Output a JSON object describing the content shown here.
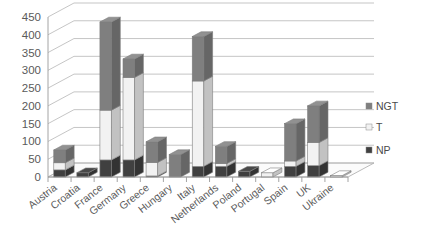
{
  "chart_data": {
    "type": "bar",
    "subtype": "stacked-bar-3d",
    "title": "",
    "xlabel": "",
    "ylabel": "",
    "ylim": [
      0,
      450
    ],
    "ytick_step": 50,
    "yticks": [
      "0",
      "50",
      "100",
      "150",
      "200",
      "250",
      "300",
      "350",
      "400",
      "450"
    ],
    "grid": true,
    "legend_position": "right",
    "categories": [
      "Austria",
      "Croatia",
      "France",
      "Germany",
      "Greece",
      "Hungary",
      "Italy",
      "Netherlands",
      "Poland",
      "Portugal",
      "Spain",
      "UK",
      "Ukraine"
    ],
    "series": [
      {
        "name": "NP",
        "color": "#404040",
        "values": [
          20,
          12,
          48,
          48,
          3,
          0,
          30,
          30,
          16,
          0,
          30,
          32,
          0
        ]
      },
      {
        "name": "T",
        "color": "#f2f2f2",
        "values": [
          20,
          0,
          140,
          232,
          38,
          0,
          240,
          8,
          0,
          12,
          15,
          65,
          4
        ]
      },
      {
        "name": "NGT",
        "color": "#7f7f7f",
        "values": [
          36,
          0,
          248,
          52,
          58,
          63,
          125,
          48,
          0,
          0,
          105,
          103,
          0
        ]
      }
    ],
    "totals": [
      76,
      12,
      436,
      332,
      99,
      63,
      395,
      86,
      16,
      12,
      150,
      200,
      4
    ]
  },
  "legend": {
    "items": [
      {
        "label": "NGT",
        "color": "#7f7f7f"
      },
      {
        "label": "T",
        "color": "#f2f2f2"
      },
      {
        "label": "NP",
        "color": "#404040"
      }
    ]
  }
}
